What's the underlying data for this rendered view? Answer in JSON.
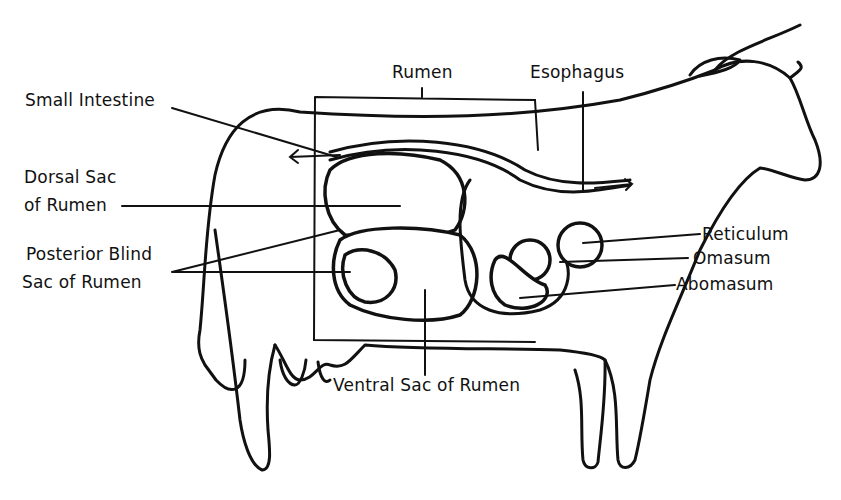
{
  "diagram": {
    "labels": {
      "rumen": "Rumen",
      "esophagus": "Esophagus",
      "small_intestine": "Small Intestine",
      "dorsal_sac_line1": "Dorsal Sac",
      "dorsal_sac_line2": "of Rumen",
      "posterior_blind_sac_line1": "Posterior Blind",
      "posterior_blind_sac_line2": "Sac of Rumen",
      "reticulum": "Reticulum",
      "omasum": "Omasum",
      "abomasum": "Abomasum",
      "ventral_sac": "Ventral Sac of Rumen"
    }
  }
}
